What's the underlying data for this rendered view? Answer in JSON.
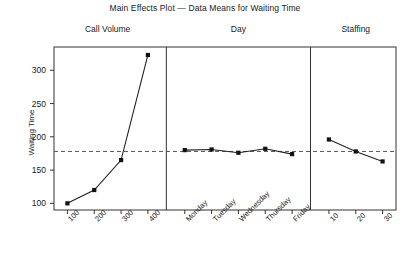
{
  "chart_data": {
    "type": "line",
    "title": "Main Effects Plot — Data Means for Waiting Time",
    "xlabel": "",
    "ylabel": "Waiting Time",
    "ylim": [
      90,
      335
    ],
    "yticks": [
      100,
      150,
      200,
      250,
      300
    ],
    "grid": false,
    "legend": false,
    "reference_line": {
      "value": 178,
      "style": "dashed"
    },
    "panels": [
      {
        "name": "Call Volume",
        "categories": [
          "100",
          "200",
          "300",
          "400"
        ],
        "values": [
          100,
          120,
          165,
          323
        ]
      },
      {
        "name": "Day",
        "categories": [
          "Monday",
          "Tuesday",
          "Wednesday",
          "Thursday",
          "Friday"
        ],
        "values": [
          180,
          181,
          176,
          182,
          174
        ]
      },
      {
        "name": "Staffing",
        "categories": [
          "10",
          "20",
          "30"
        ],
        "values": [
          196,
          178,
          163
        ]
      }
    ]
  },
  "marker_color": "#111111",
  "line_color": "#222222",
  "axis_color": "#333333",
  "reference_line_color": "#555555"
}
